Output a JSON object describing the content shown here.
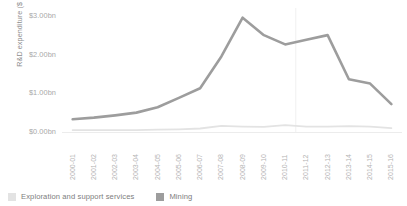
{
  "chart_data": {
    "type": "line",
    "title": "",
    "xlabel": "",
    "ylabel": "R&D expenditure ($ billion)",
    "ylim": [
      0,
      3.2
    ],
    "yticks": [
      0,
      1,
      2,
      3
    ],
    "ytick_labels": [
      "$0.00bn",
      "$1.00bn",
      "$2.00bn",
      "$3.00bn"
    ],
    "grid": false,
    "legend_position": "bottom-left",
    "categories": [
      "2000-01",
      "2001-02",
      "2002-03",
      "2003-04",
      "2004-05",
      "2005-06",
      "2006-07",
      "2007-08",
      "2008-09",
      "2009-10",
      "2010-11",
      "2011-12",
      "2012-13",
      "2013-14",
      "2014-15",
      "2015-16"
    ],
    "series": [
      {
        "name": "Exploration and support services",
        "color": "#e3e3e3",
        "values": [
          0.05,
          0.05,
          0.05,
          0.05,
          0.06,
          0.07,
          0.09,
          0.16,
          0.14,
          0.13,
          0.18,
          0.14,
          0.14,
          0.15,
          0.14,
          0.1
        ]
      },
      {
        "name": "Mining",
        "color": "#9d9d9d",
        "values": [
          0.33,
          0.37,
          0.43,
          0.5,
          0.64,
          0.88,
          1.13,
          1.95,
          2.95,
          2.5,
          2.26,
          2.38,
          2.5,
          1.36,
          1.25,
          0.72
        ]
      }
    ]
  },
  "legend": {
    "items": [
      {
        "label": "Exploration and support services",
        "color": "#e3e3e3"
      },
      {
        "label": "Mining",
        "color": "#9d9d9d"
      }
    ]
  },
  "colors": {
    "axis": "#ececec",
    "tick_text": "#a9a9a9",
    "axis_title": "#8d8d8d",
    "gridline_vertical": "#f0f0f0",
    "background": "#ffffff"
  }
}
